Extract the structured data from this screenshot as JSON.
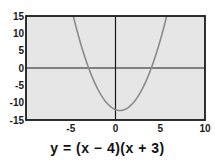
{
  "chart_data": {
    "type": "line",
    "title": "",
    "caption": "y = (x − 4)(x + 3)",
    "function": "y = (x - 4)(x + 3)",
    "xlabel": "",
    "ylabel": "",
    "xlim": [
      -10,
      10
    ],
    "ylim": [
      -15,
      15
    ],
    "x_ticks": [
      -5,
      0,
      5,
      10
    ],
    "y_ticks": [
      15,
      10,
      5,
      0,
      -5,
      -10,
      -15
    ],
    "grid": false,
    "legend": null,
    "series": [
      {
        "name": "y = (x - 4)(x + 3)",
        "x": [
          -4.72,
          -4,
          -3,
          -2,
          -1,
          0,
          0.5,
          1,
          2,
          3,
          4,
          5,
          5.72
        ],
        "y": [
          15,
          8,
          0,
          -6,
          -10,
          -12,
          -12.25,
          -12,
          -10,
          -6,
          0,
          8,
          15
        ]
      }
    ],
    "colors": {
      "plot_background": "#e6e6e6",
      "curve": "#8a8a8a",
      "axes": "#1a1a1a",
      "frame": "#1a1a1a"
    }
  }
}
